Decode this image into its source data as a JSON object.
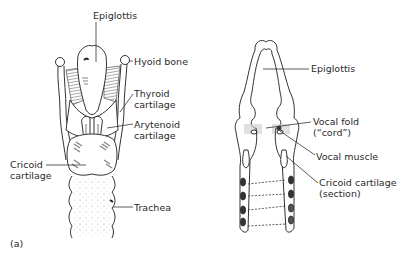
{
  "figure": {
    "panel_label": "(a)",
    "left_view": {
      "labels": {
        "epiglottis": "Epiglottis",
        "hyoid_bone": "Hyoid bone",
        "thyroid_cartilage": [
          "Thyroid",
          "cartilage"
        ],
        "arytenoid_cartilage": [
          "Arytenoid",
          "cartilage"
        ],
        "cricoid_cartilage": [
          "Cricoid",
          "cartilage"
        ],
        "trachea": "Trachea"
      }
    },
    "right_view": {
      "labels": {
        "epiglottis": "Epiglottis",
        "vocal_fold": [
          "Vocal fold",
          "(“cord”)"
        ],
        "vocal_muscle": "Vocal muscle",
        "cricoid_cartilage_section": [
          "Cricoid cartilage",
          "(section)"
        ]
      }
    },
    "colors": {
      "line": "#333333",
      "shading": "#777777",
      "background": "#ffffff"
    }
  }
}
